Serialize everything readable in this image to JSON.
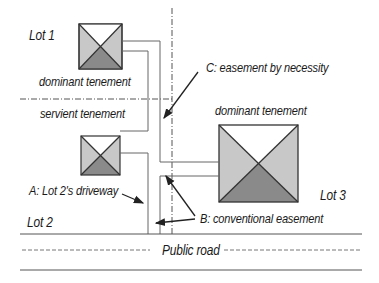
{
  "diagram": {
    "labels": {
      "lot1": "Lot 1",
      "lot2": "Lot 2",
      "lot3": "Lot 3",
      "dominant_tenement_1": "dominant tenement",
      "servient_tenement": "servient tenement",
      "dominant_tenement_3": "dominant tenement",
      "easement_c": "C: easement by necessity",
      "driveway_a": "A: Lot 2's driveway",
      "easement_b": "B: conventional easement",
      "public_road": "Public road"
    },
    "colors": {
      "line": "#555555",
      "roof_light": "#c8c8c8",
      "roof_dark": "#8a8a8a",
      "roof_top": "#ffffff",
      "text": "#1a1a1a"
    }
  }
}
